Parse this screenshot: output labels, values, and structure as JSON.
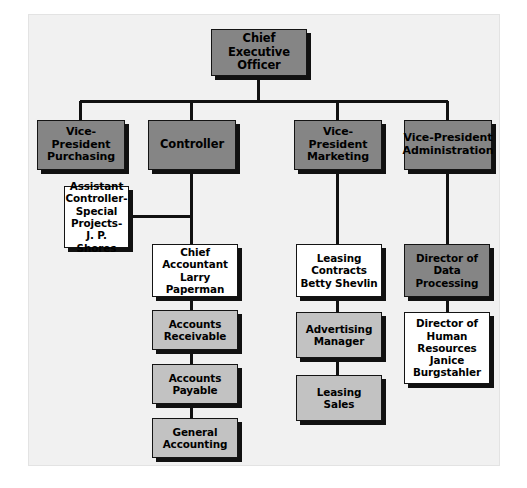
{
  "diagram": {
    "background_color": "#f1f1f1",
    "page_color": "#ffffff",
    "connector_color": "#111111",
    "shadow_color": "#111111",
    "fills": {
      "executive": "#858585",
      "operating": "#c2c2c2",
      "staff": "#ffffff"
    },
    "nodes": [
      {
        "id": "ceo",
        "label": "Chief Executive\nOfficer",
        "fill": "#858585",
        "fill_class": "fill-dark",
        "size_class": "s-12",
        "x": 211,
        "y": 29,
        "w": 96,
        "h": 47,
        "level": 0
      },
      {
        "id": "vp-purchasing",
        "label": "Vice-President\nPurchasing",
        "fill": "#858585",
        "fill_class": "fill-dark",
        "size_class": "s-11",
        "x": 37,
        "y": 120,
        "w": 88,
        "h": 50,
        "level": 1
      },
      {
        "id": "controller",
        "label": "Controller",
        "fill": "#858585",
        "fill_class": "fill-dark",
        "size_class": "s-12",
        "x": 148,
        "y": 120,
        "w": 88,
        "h": 50,
        "level": 1
      },
      {
        "id": "vp-marketing",
        "label": "Vice-President\nMarketing",
        "fill": "#858585",
        "fill_class": "fill-dark",
        "size_class": "s-11",
        "x": 294,
        "y": 120,
        "w": 88,
        "h": 50,
        "level": 1
      },
      {
        "id": "vp-administration",
        "label": "Vice-President\nAdministration",
        "fill": "#858585",
        "fill_class": "fill-dark",
        "size_class": "s-11",
        "x": 404,
        "y": 120,
        "w": 88,
        "h": 50,
        "level": 1
      },
      {
        "id": "assistant-controller",
        "label": "Assistant\nController-\nSpecial Projects-\nJ. P. Shores",
        "fill": "#ffffff",
        "fill_class": "fill-white",
        "size_class": "s-10",
        "x": 64,
        "y": 186,
        "w": 65,
        "h": 62,
        "level": 2
      },
      {
        "id": "chief-accountant",
        "label": "Chief\nAccountant\nLarry Paperman",
        "fill": "#ffffff",
        "fill_class": "fill-white",
        "size_class": "s-10",
        "x": 152,
        "y": 244,
        "w": 86,
        "h": 53,
        "level": 2
      },
      {
        "id": "accounts-receivable",
        "label": "Accounts\nReceivable",
        "fill": "#c2c2c2",
        "fill_class": "fill-light",
        "size_class": "s-10",
        "x": 152,
        "y": 310,
        "w": 86,
        "h": 40,
        "level": 3
      },
      {
        "id": "accounts-payable",
        "label": "Accounts\nPayable",
        "fill": "#c2c2c2",
        "fill_class": "fill-light",
        "size_class": "s-10",
        "x": 152,
        "y": 364,
        "w": 86,
        "h": 40,
        "level": 4
      },
      {
        "id": "general-accounting",
        "label": "General\nAccounting",
        "fill": "#c2c2c2",
        "fill_class": "fill-light",
        "size_class": "s-10",
        "x": 152,
        "y": 418,
        "w": 86,
        "h": 40,
        "level": 5
      },
      {
        "id": "leasing-contracts",
        "label": "Leasing\nContracts\nBetty Shevlin",
        "fill": "#ffffff",
        "fill_class": "fill-white",
        "size_class": "s-10",
        "x": 296,
        "y": 244,
        "w": 86,
        "h": 53,
        "level": 2
      },
      {
        "id": "advertising-manager",
        "label": "Advertising\nManager",
        "fill": "#c2c2c2",
        "fill_class": "fill-light",
        "size_class": "s-10",
        "x": 296,
        "y": 312,
        "w": 86,
        "h": 46,
        "level": 3
      },
      {
        "id": "leasing-sales",
        "label": "Leasing\nSales",
        "fill": "#c2c2c2",
        "fill_class": "fill-light",
        "size_class": "s-10",
        "x": 296,
        "y": 375,
        "w": 86,
        "h": 46,
        "level": 4
      },
      {
        "id": "director-data-processing",
        "label": "Director of\nData\nProcessing",
        "fill": "#858585",
        "fill_class": "fill-dark",
        "size_class": "s-10",
        "x": 404,
        "y": 244,
        "w": 86,
        "h": 53,
        "level": 2
      },
      {
        "id": "director-human-resources",
        "label": "Director of\nHuman\nResources\nJanice\nBurgstahler",
        "fill": "#ffffff",
        "fill_class": "fill-white",
        "size_class": "s-10",
        "x": 404,
        "y": 312,
        "w": 86,
        "h": 72,
        "level": 3
      }
    ],
    "connectors": [
      {
        "id": "ceo-stem",
        "orient": "v",
        "x": 258,
        "y": 76,
        "len": 27
      },
      {
        "id": "level1-bus",
        "orient": "h",
        "x": 80,
        "y": 101,
        "len": 368
      },
      {
        "id": "drop-vp-purchasing",
        "orient": "v",
        "x": 80,
        "y": 101,
        "len": 19
      },
      {
        "id": "drop-controller",
        "orient": "v",
        "x": 191,
        "y": 101,
        "len": 19
      },
      {
        "id": "drop-vp-marketing",
        "orient": "v",
        "x": 337,
        "y": 101,
        "len": 19
      },
      {
        "id": "drop-vp-admin",
        "orient": "v",
        "x": 447,
        "y": 101,
        "len": 19
      },
      {
        "id": "controller-stem",
        "orient": "v",
        "x": 191,
        "y": 170,
        "len": 74
      },
      {
        "id": "assistant-tie",
        "orient": "h",
        "x": 129,
        "y": 216,
        "len": 62
      },
      {
        "id": "acct-link-1",
        "orient": "v",
        "x": 191,
        "y": 297,
        "len": 13
      },
      {
        "id": "acct-link-2",
        "orient": "v",
        "x": 191,
        "y": 350,
        "len": 14
      },
      {
        "id": "acct-link-3",
        "orient": "v",
        "x": 191,
        "y": 404,
        "len": 14
      },
      {
        "id": "marketing-stem",
        "orient": "v",
        "x": 337,
        "y": 170,
        "len": 74
      },
      {
        "id": "mkt-link-1",
        "orient": "v",
        "x": 337,
        "y": 297,
        "len": 15
      },
      {
        "id": "mkt-link-2",
        "orient": "v",
        "x": 337,
        "y": 358,
        "len": 17
      },
      {
        "id": "admin-stem",
        "orient": "v",
        "x": 447,
        "y": 170,
        "len": 74
      },
      {
        "id": "admin-link-1",
        "orient": "v",
        "x": 447,
        "y": 297,
        "len": 15
      }
    ]
  }
}
